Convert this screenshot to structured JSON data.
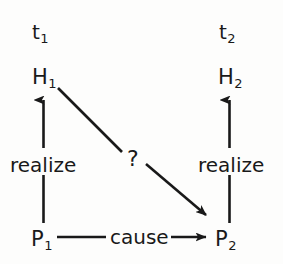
{
  "diagram": {
    "type": "causal-supervenience-diagram",
    "colors": {
      "background": "#fdfdfc",
      "ink": "#191919"
    },
    "time_labels": [
      {
        "id": "t1",
        "base": "t",
        "sub": "1"
      },
      {
        "id": "t2",
        "base": "t",
        "sub": "2"
      }
    ],
    "nodes": [
      {
        "id": "h1",
        "base": "H",
        "sub": "1"
      },
      {
        "id": "h2",
        "base": "H",
        "sub": "2"
      },
      {
        "id": "p1",
        "base": "P",
        "sub": "1"
      },
      {
        "id": "p2",
        "base": "P",
        "sub": "2"
      }
    ],
    "edges": [
      {
        "id": "p1-to-h1",
        "label": "realize",
        "from": "p1",
        "to": "h1",
        "direction": "up",
        "style": "solid-arrow"
      },
      {
        "id": "p2-to-h2",
        "label": "realize",
        "from": "p2",
        "to": "h2",
        "direction": "up",
        "style": "solid-arrow"
      },
      {
        "id": "p1-to-p2",
        "label": "cause",
        "from": "p1",
        "to": "p2",
        "direction": "right",
        "style": "solid-arrow"
      },
      {
        "id": "h1-to-p2",
        "label": "?",
        "from": "h1",
        "to": "p2",
        "direction": "diagonal-down-right",
        "style": "solid-arrow"
      }
    ]
  }
}
